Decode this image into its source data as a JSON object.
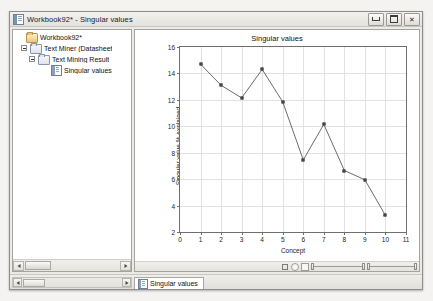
{
  "window": {
    "title": "Workbook92* - Singular values",
    "icon": "workbook-icon",
    "controls": {
      "minimize": "minimize-button",
      "maximize": "maximize-button",
      "close_glyph": "✕"
    }
  },
  "tree": {
    "nodes": [
      {
        "label": "Workbook92*",
        "depth": 0,
        "expander": "none",
        "icon": "folder-icon"
      },
      {
        "label": "Text Miner (Datasheet",
        "depth": 1,
        "expander": "collapse",
        "icon": "folder-icon"
      },
      {
        "label": "Text Mining Result",
        "depth": 2,
        "expander": "collapse",
        "icon": "folder-icon"
      },
      {
        "label": "Singular values",
        "depth": 3,
        "expander": "none",
        "icon": "report-icon"
      }
    ],
    "hscroll": {
      "left_arrow": "◄",
      "right_arrow": "►"
    }
  },
  "chart_data": {
    "type": "line",
    "title": "Singular values",
    "xlabel": "Concept",
    "ylabel": "Singular value % explained",
    "x": [
      1,
      2,
      3,
      4,
      5,
      6,
      7,
      8,
      9,
      10
    ],
    "values": [
      14.7,
      13.1,
      12.15,
      14.3,
      11.85,
      7.45,
      10.15,
      6.65,
      5.95,
      3.25
    ],
    "xlim": [
      0,
      11
    ],
    "ylim": [
      2,
      16
    ],
    "xticks": [
      0,
      1,
      2,
      3,
      4,
      5,
      6,
      7,
      8,
      9,
      10,
      11
    ],
    "yticks": [
      2,
      4,
      6,
      8,
      10,
      12,
      14,
      16
    ],
    "grid": true,
    "legend": false,
    "marker": "square",
    "line_color": "#5a5a5a",
    "marker_color": "#6a6a6a"
  },
  "chart_toolbar": {
    "items": [
      "zoom-icon",
      "point-icon",
      "grid-icon",
      "horizontal-scroll-slider",
      "vertical-scroll-slider"
    ]
  },
  "statusbar": {
    "hscroll": {
      "left_arrow": "◄",
      "right_arrow": "►"
    },
    "tabs": [
      {
        "label": "Singular values",
        "icon": "report-icon",
        "active": true
      }
    ]
  }
}
